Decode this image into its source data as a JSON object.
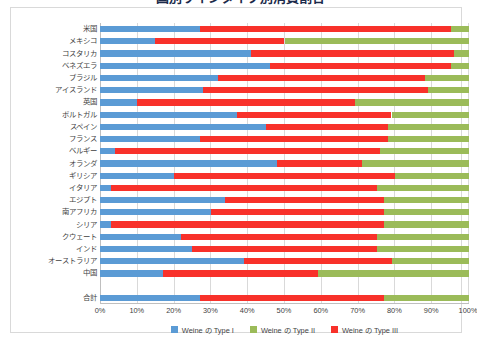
{
  "title": "国別ワインタイプ別消費割合",
  "chart_data": {
    "type": "bar",
    "orientation": "horizontal",
    "stacked": true,
    "stack_mode": "percent",
    "title": "国別ワインタイプ別消費割合",
    "xlabel": "",
    "ylabel": "",
    "xlim": [
      0,
      100
    ],
    "grid": true,
    "legend_position": "bottom",
    "xticks": [
      "0%",
      "10%",
      "20%",
      "30%",
      "40%",
      "50%",
      "60%",
      "70%",
      "80%",
      "90%",
      "100%"
    ],
    "xtick_values": [
      0,
      10,
      20,
      30,
      40,
      50,
      60,
      70,
      80,
      90,
      100
    ],
    "categories": [
      "米国",
      "メキシコ",
      "コスタリカ",
      "ベネズエラ",
      "ブラジル",
      "アイスランド",
      "英国",
      "ポルトガル",
      "スペイン",
      "フランス",
      "ベルギー",
      "オランダ",
      "ギリシア",
      "イタリア",
      "エジプト",
      "南アフリカ",
      "シリア",
      "クウェート",
      "インド",
      "オーストラリア",
      "中国",
      "合計"
    ],
    "series": [
      {
        "name": "Weine の Type I",
        "color": "#5B9BD5",
        "values": [
          27,
          15,
          41,
          46,
          32,
          28,
          10,
          37,
          45,
          27,
          4,
          48,
          20,
          3,
          34,
          30,
          3,
          22,
          25,
          39,
          17,
          27
        ]
      },
      {
        "name": "Weine の Type III",
        "color": "#F8312A",
        "values": [
          68,
          35,
          55,
          49,
          56,
          61,
          59,
          42,
          33,
          51,
          72,
          23,
          60,
          72,
          43,
          47,
          74,
          53,
          50,
          40,
          42,
          50
        ]
      },
      {
        "name": "Weine の Type II",
        "color": "#9BBB59",
        "values": [
          5,
          50,
          4,
          5,
          12,
          11,
          31,
          21,
          22,
          22,
          24,
          29,
          20,
          25,
          23,
          23,
          23,
          25,
          25,
          21,
          41,
          23
        ]
      }
    ],
    "series_draw_order": [
      "Weine の Type I",
      "Weine の Type III",
      "Weine の Type II"
    ]
  },
  "legend": {
    "items": [
      {
        "label": "Weine の Type I",
        "color": "#5B9BD5"
      },
      {
        "label": "Weine の Type II",
        "color": "#9BBB59"
      },
      {
        "label": "Weine の Type III",
        "color": "#F8312A"
      }
    ]
  }
}
